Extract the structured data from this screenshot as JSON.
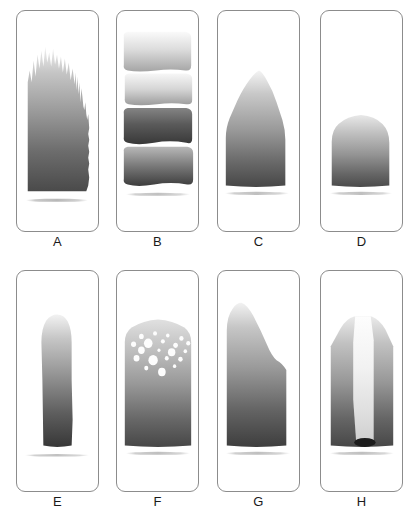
{
  "figure": {
    "title": "",
    "background_color": "#ffffff",
    "border_color": "#8c8c8c",
    "label_color": "#1a1a1a",
    "layout": {
      "columns": 4,
      "rows": 2,
      "panel_width": 83,
      "panel_height": 222,
      "row1_top": 10,
      "row2_top": 270,
      "column_lefts": [
        16,
        116,
        217,
        320
      ],
      "label_row1_y": 234,
      "label_row2_y": 494
    },
    "gradient_stops": {
      "top": "#f2f2f2",
      "upper_mid": "#c9c9c9",
      "mid": "#9e9e9e",
      "lower_mid": "#6e6e6e",
      "bottom": "#3d3d3d"
    },
    "panels": [
      {
        "id": "A",
        "label": "A",
        "description": "tall jagged spiky column with ragged irregular crest and small notches along right edge",
        "shape": "jagged-column",
        "fill_top": "#ededed",
        "fill_bottom": "#555555",
        "top_fraction": 0.22,
        "bottom_fraction": 0.82,
        "shadow_y": 0.855,
        "bands": []
      },
      {
        "id": "B",
        "label": "B",
        "description": "four separate stacked horizontal bands of differing darkness, top two lighter, third darkest, fourth dark",
        "shape": "stacked-bands",
        "fill_top": "#ededed",
        "fill_bottom": "#4a4a4a",
        "top_fraction": 0.1,
        "bottom_fraction": 0.79,
        "shadow_y": 0.83,
        "bands": [
          {
            "index": 1,
            "top": 0.1,
            "bottom": 0.27,
            "top_color": "#f5f5f5",
            "bottom_color": "#a8a8a8"
          },
          {
            "index": 2,
            "top": 0.29,
            "bottom": 0.42,
            "top_color": "#f2f2f2",
            "bottom_color": "#9f9f9f"
          },
          {
            "index": 3,
            "top": 0.45,
            "bottom": 0.6,
            "top_color": "#7a7a7a",
            "bottom_color": "#3a3a3a"
          },
          {
            "index": 4,
            "top": 0.63,
            "bottom": 0.79,
            "top_color": "#b0b0b0",
            "bottom_color": "#3f3f3f"
          }
        ]
      },
      {
        "id": "C",
        "label": "C",
        "description": "rounded dome peak tapering to narrow rounded top, widening to full-width base",
        "shape": "dome-peak",
        "fill_top": "#f0f0f0",
        "fill_bottom": "#4a4a4a",
        "top_fraction": 0.33,
        "bottom_fraction": 0.79,
        "shadow_y": 0.83,
        "bands": []
      },
      {
        "id": "D",
        "label": "D",
        "description": "short low rounded mound occupying only the lower portion of the panel",
        "shape": "low-mound",
        "fill_top": "#e3e3e3",
        "fill_bottom": "#4d4d4d",
        "top_fraction": 0.53,
        "bottom_fraction": 0.79,
        "shadow_y": 0.83,
        "bands": []
      },
      {
        "id": "E",
        "label": "E",
        "description": "narrow tall vertical column centered in panel, rounded top, straight sides",
        "shape": "narrow-column",
        "fill_top": "#ededed",
        "fill_bottom": "#3a3a3a",
        "top_fraction": 0.21,
        "bottom_fraction": 0.79,
        "shadow_y": 0.83,
        "bands": []
      },
      {
        "id": "F",
        "label": "F",
        "description": "wide block with rounded top scattered with many irregular white bubble voids in upper half",
        "shape": "bubbled-block",
        "fill_top": "#dcdcdc",
        "fill_bottom": "#4a4a4a",
        "top_fraction": 0.24,
        "bottom_fraction": 0.79,
        "shadow_y": 0.83,
        "bands": [],
        "bubbles": [
          {
            "cx": 0.3,
            "cy": 0.295,
            "rx": 0.03,
            "ry": 0.012
          },
          {
            "cx": 0.47,
            "cy": 0.285,
            "rx": 0.025,
            "ry": 0.01
          },
          {
            "cx": 0.63,
            "cy": 0.29,
            "rx": 0.022,
            "ry": 0.009
          },
          {
            "cx": 0.8,
            "cy": 0.3,
            "rx": 0.028,
            "ry": 0.011
          },
          {
            "cx": 0.21,
            "cy": 0.33,
            "rx": 0.032,
            "ry": 0.013
          },
          {
            "cx": 0.39,
            "cy": 0.325,
            "rx": 0.055,
            "ry": 0.021
          },
          {
            "cx": 0.57,
            "cy": 0.32,
            "rx": 0.024,
            "ry": 0.01
          },
          {
            "cx": 0.72,
            "cy": 0.335,
            "rx": 0.03,
            "ry": 0.012
          },
          {
            "cx": 0.88,
            "cy": 0.33,
            "rx": 0.026,
            "ry": 0.011
          },
          {
            "cx": 0.3,
            "cy": 0.362,
            "rx": 0.042,
            "ry": 0.017
          },
          {
            "cx": 0.52,
            "cy": 0.358,
            "rx": 0.02,
            "ry": 0.008
          },
          {
            "cx": 0.68,
            "cy": 0.368,
            "rx": 0.048,
            "ry": 0.018
          },
          {
            "cx": 0.85,
            "cy": 0.362,
            "rx": 0.022,
            "ry": 0.009
          },
          {
            "cx": 0.24,
            "cy": 0.398,
            "rx": 0.038,
            "ry": 0.015
          },
          {
            "cx": 0.44,
            "cy": 0.405,
            "rx": 0.06,
            "ry": 0.024
          },
          {
            "cx": 0.62,
            "cy": 0.395,
            "rx": 0.024,
            "ry": 0.01
          },
          {
            "cx": 0.79,
            "cy": 0.4,
            "rx": 0.028,
            "ry": 0.011
          },
          {
            "cx": 0.36,
            "cy": 0.438,
            "rx": 0.026,
            "ry": 0.011
          },
          {
            "cx": 0.55,
            "cy": 0.455,
            "rx": 0.048,
            "ry": 0.02
          },
          {
            "cx": 0.71,
            "cy": 0.43,
            "rx": 0.02,
            "ry": 0.008
          }
        ]
      },
      {
        "id": "G",
        "label": "G",
        "description": "asymmetric wedge, tall on left sloping down to a shoulder on the right then vertical",
        "shape": "asymmetric-wedge",
        "fill_top": "#ededed",
        "fill_bottom": "#3f3f3f",
        "top_fraction": 0.15,
        "bottom_fraction": 0.79,
        "shadow_y": 0.83,
        "bands": []
      },
      {
        "id": "H",
        "label": "H",
        "description": "broad block with bright light vertical stripe down the center and a dark ellipse at the stripe base",
        "shape": "striped-block",
        "fill_top": "#e8e8e8",
        "fill_bottom": "#4a4a4a",
        "stripe_color_top": "#fbfbfb",
        "stripe_color_bottom": "#d6d6d6",
        "ellipse_color": "#1c1c1c",
        "top_fraction": 0.23,
        "bottom_fraction": 0.79,
        "shadow_y": 0.83,
        "bands": []
      }
    ]
  }
}
